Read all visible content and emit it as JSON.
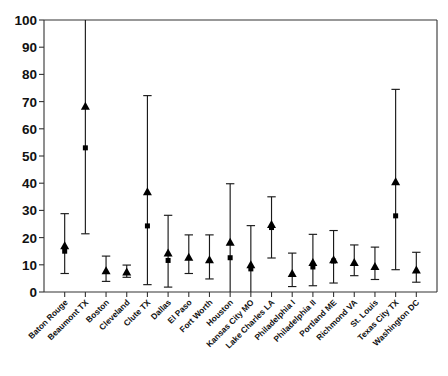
{
  "chart_data": {
    "type": "scatter",
    "title": "",
    "xlabel": "",
    "ylabel": "",
    "ylim": [
      0,
      100
    ],
    "ytick_step": 10,
    "yticks": [
      0,
      10,
      20,
      30,
      40,
      50,
      60,
      70,
      80,
      90,
      100
    ],
    "ytick_labels": [
      "0",
      "10",
      "20",
      "30",
      "40",
      "50",
      "60",
      "70",
      "80",
      "90",
      "100"
    ],
    "grid": false,
    "legend": "none",
    "marker_colors": {
      "triangle": "#000000",
      "square": "#000000",
      "errorbar": "#1a1a1a"
    },
    "categories": [
      "Baton Rouge",
      "Beaumont TX",
      "Boston",
      "Cleveland",
      "Clute TX",
      "Dallas",
      "El Paso",
      "Fort Worth",
      "Houston",
      "Kansas City MO",
      "Lake Charles LA",
      "Philadelphia I",
      "Philadelphia II",
      "Portland ME",
      "Richmond VA",
      "St. Louis",
      "Texas City TX",
      "Washington DC"
    ],
    "series": [
      {
        "name": "triangle",
        "marker": "triangle",
        "values": [
          17.2,
          68.5,
          8.0,
          7.5,
          37.0,
          14.5,
          13.0,
          12.0,
          18.5,
          10.2,
          25.0,
          7.0,
          11.0,
          12.0,
          11.0,
          9.6,
          40.7,
          8.3
        ]
      },
      {
        "name": "square",
        "marker": "square",
        "values": [
          15.0,
          53.0,
          null,
          null,
          24.3,
          11.6,
          null,
          null,
          12.6,
          8.5,
          23.7,
          null,
          9.2,
          11.4,
          null,
          null,
          28.0,
          null
        ]
      }
    ],
    "error_bars": {
      "lower": [
        6.8,
        21.4,
        3.9,
        5.4,
        2.7,
        1.8,
        6.8,
        4.8,
        0.0,
        0.0,
        12.5,
        2.0,
        2.3,
        3.3,
        6.0,
        4.6,
        8.2,
        3.6
      ],
      "upper": [
        28.8,
        100.0,
        13.2,
        9.9,
        72.2,
        28.2,
        21.0,
        21.0,
        39.8,
        24.4,
        35.0,
        14.3,
        21.2,
        22.6,
        17.3,
        16.5,
        74.5,
        14.6
      ],
      "upper_clipped": [
        false,
        true,
        false,
        false,
        false,
        false,
        false,
        false,
        false,
        false,
        false,
        false,
        false,
        false,
        false,
        false,
        false,
        false
      ]
    }
  },
  "axes": {
    "y_axis_name": "y-axis",
    "x_axis_name": "x-axis"
  }
}
